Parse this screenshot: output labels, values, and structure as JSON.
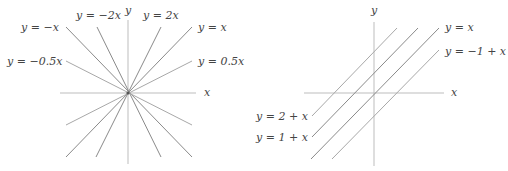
{
  "left_plot": {
    "axis_labels": {
      "x": "x",
      "y": "y"
    },
    "lines": [
      {
        "label": "y = −x",
        "slope": -1
      },
      {
        "label": "y = −2x",
        "slope": -2
      },
      {
        "label": "y = 2x",
        "slope": 2
      },
      {
        "label": "y = x",
        "slope": 1
      },
      {
        "label": "y = −0.5x",
        "slope": -0.5
      },
      {
        "label": "y = 0.5x",
        "slope": 0.5
      }
    ]
  },
  "right_plot": {
    "axis_labels": {
      "x": "x",
      "y": "y"
    },
    "lines": [
      {
        "label": "y = x",
        "intercept": 0
      },
      {
        "label": "y = −1 + x",
        "intercept": -1
      },
      {
        "label": "y = 2 + x",
        "intercept": 2
      },
      {
        "label": "y = 1 + x",
        "intercept": 1
      }
    ]
  }
}
